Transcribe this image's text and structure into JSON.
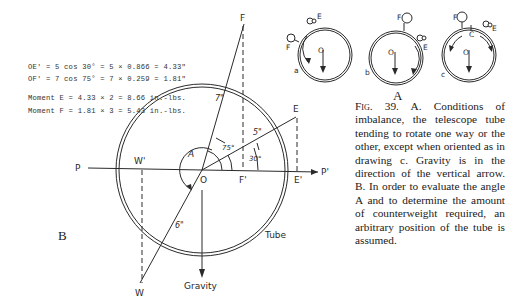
{
  "figure": {
    "number": "Fig. 39.",
    "caption": "A. Conditions of imbalance, the telescope tube tending to rotate one way or the other, except when oriented as in drawing c. Gravity is in the direction of the vertical arrow. B. In order to evaluate the angle A and to determine the amount of counterweight required, an arbitrary position of the tube is assumed."
  },
  "calculations": [
    "OE' = 5 cos 30° = 5 × 0.866 = 4.33\"",
    "OF' = 7 cos 75° = 7 × 0.259 = 1.81\"",
    "Moment E = 4.33 × 2 = 8.66 in.-lbs.",
    "Moment F = 1.81 × 3 = 5.43 in.-lbs."
  ],
  "panel_a": {
    "label": "A",
    "drawings": [
      {
        "id": "a",
        "center_label": "O",
        "weights": [
          "F",
          "E"
        ]
      },
      {
        "id": "b",
        "center_label": "O",
        "weights": [
          "F",
          "E"
        ]
      },
      {
        "id": "c",
        "center_label": "O",
        "weights": [
          "F",
          "E"
        ],
        "balance_point": "C"
      }
    ]
  },
  "panel_b": {
    "label": "B",
    "points": {
      "F": "F",
      "E": "E",
      "W": "W",
      "W_prime": "W'",
      "O": "O",
      "F_prime": "F'",
      "E_prime": "E'",
      "P": "P",
      "P_prime": "P'"
    },
    "distances": {
      "F": "7\"",
      "E": "5\"",
      "W": "6\""
    },
    "angles": {
      "F": "75°",
      "E": "30°",
      "A": "A"
    },
    "labels": {
      "tube": "Tube",
      "gravity": "Gravity"
    }
  }
}
